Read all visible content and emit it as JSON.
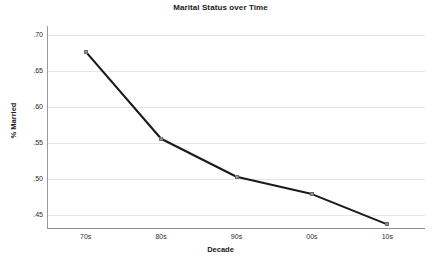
{
  "chart_data": {
    "type": "line",
    "title": "Marital Status over Time",
    "xlabel": "Decade",
    "ylabel": "% Married",
    "categories": [
      "70s",
      "80s",
      "90s",
      "00s",
      "10s"
    ],
    "values": [
      0.677,
      0.556,
      0.503,
      0.479,
      0.437
    ],
    "ytick_labels": [
      ".70",
      ".65",
      ".60",
      ".55",
      ".50",
      ".45"
    ],
    "ytick_values": [
      0.7,
      0.65,
      0.6,
      0.55,
      0.5,
      0.45
    ],
    "ylim": [
      0.425,
      0.7
    ],
    "grid": true,
    "legend": "none",
    "line_color": "#1a1a1a",
    "marker_color": "#8f8f8f",
    "grid_color": "#e6e6e6",
    "axis_color": "#8d8d8d",
    "marker_shape": "square",
    "series": [
      {
        "name": "% Married",
        "values": [
          0.677,
          0.556,
          0.503,
          0.479,
          0.437
        ]
      }
    ]
  }
}
